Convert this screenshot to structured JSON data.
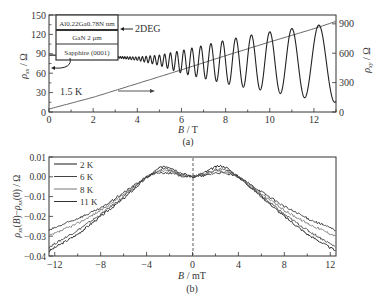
{
  "figure": {
    "panel_a_label": "(a)",
    "panel_b_label": "(b)"
  },
  "chart_data": [
    {
      "type": "line",
      "panel": "(a)",
      "xlabel": "B / T",
      "ylabel": "ρxx / Ω",
      "y2label": "ρxy / Ω",
      "xlim": [
        0,
        13
      ],
      "ylim": [
        0,
        150
      ],
      "y2lim": [
        0,
        990
      ],
      "xticks": [
        0,
        2,
        4,
        6,
        8,
        10,
        12
      ],
      "yticks": [
        0,
        30,
        60,
        90,
        120,
        150
      ],
      "y2ticks": [
        0,
        300,
        600,
        900
      ],
      "grid": false,
      "annotations": {
        "temperature": "1.5 K",
        "layer_stack": [
          "Al0.22Ga0.78N nm",
          "GaN   2 μm",
          "Sapphire (0001)"
        ],
        "layer_label": "2DEG",
        "arrow_left": "ρxx → left axis",
        "arrow_right": "ρxy → right axis"
      },
      "series": [
        {
          "name": "ρxx (Shubnikov–de Haas oscillations)",
          "axis": "left",
          "description": "Baseline ~88 Ω at B=0, slowly decreasing; oscillations begin near 3 T and grow in amplitude, reaching minima ~15 Ω and maxima ~135 Ω near 12.5 T",
          "x": [
            0,
            2,
            3,
            4,
            5,
            6,
            7,
            8,
            9,
            10,
            11,
            12,
            12.5,
            13
          ],
          "envelope_max": [
            88,
            87,
            86,
            85,
            88,
            95,
            103,
            111,
            118,
            124,
            129,
            134,
            135,
            135
          ],
          "envelope_min": [
            88,
            87,
            84,
            80,
            72,
            60,
            52,
            44,
            37,
            32,
            25,
            20,
            16,
            15
          ],
          "peaks_B": [
            8.35,
            8.85,
            9.35,
            9.95,
            10.6,
            11.4,
            12.4
          ],
          "color": "#222222"
        },
        {
          "name": "ρxy (Hall resistance)",
          "axis": "right",
          "description": "Nearly linear rise from ~0 at B=0 to ~920 Ω at 13 T",
          "x": [
            0,
            2,
            4,
            6,
            8,
            10,
            12,
            13
          ],
          "values": [
            30,
            150,
            290,
            430,
            575,
            715,
            850,
            925
          ],
          "color": "#555555"
        }
      ]
    },
    {
      "type": "line",
      "panel": "(b)",
      "xlabel": "B / mT",
      "ylabel": "ρxx(B) − ρxx(0) / Ω",
      "xlim": [
        -12.5,
        12.5
      ],
      "ylim": [
        -0.04,
        0.01
      ],
      "xticks": [
        -12,
        -8,
        -4,
        0,
        4,
        8,
        12
      ],
      "yticks": [
        -0.04,
        -0.03,
        -0.02,
        -0.01,
        0.0,
        0.01
      ],
      "grid": false,
      "legend": [
        "2 K",
        "6 K",
        "8 K",
        "11 K"
      ],
      "legend_position": "upper left",
      "annotations": {
        "dashed_vertical_line_at": 0
      },
      "series": [
        {
          "name": "2 K",
          "x": [
            -12.5,
            -10,
            -8,
            -6,
            -4,
            -3,
            -2.5,
            -2,
            -1,
            0,
            1,
            2,
            2.5,
            3,
            4,
            6,
            8,
            10,
            12.5
          ],
          "values": [
            -0.0375,
            -0.029,
            -0.02,
            -0.011,
            -0.0005,
            0.004,
            0.0055,
            0.005,
            0.002,
            0.0,
            0.002,
            0.005,
            0.0055,
            0.0045,
            0.0,
            -0.01,
            -0.02,
            -0.029,
            -0.0375
          ],
          "color": "#1a1a1a"
        },
        {
          "name": "6 K",
          "x": [
            -12.5,
            -10,
            -8,
            -6,
            -4,
            -3,
            -2.5,
            -2,
            -1,
            0,
            1,
            2,
            2.5,
            3,
            4,
            6,
            8,
            10,
            12.5
          ],
          "values": [
            -0.0355,
            -0.027,
            -0.019,
            -0.01,
            0.0,
            0.003,
            0.004,
            0.0035,
            0.0015,
            0.0,
            0.0015,
            0.0035,
            0.004,
            0.0035,
            0.0,
            -0.0095,
            -0.019,
            -0.027,
            -0.0355
          ],
          "color": "#444444"
        },
        {
          "name": "8 K",
          "x": [
            -12.5,
            -10,
            -8,
            -6,
            -4,
            -3,
            -2.5,
            -2,
            -1,
            0,
            1,
            2,
            2.5,
            3,
            4,
            6,
            8,
            10,
            12.5
          ],
          "values": [
            -0.03,
            -0.0235,
            -0.017,
            -0.009,
            0.0,
            0.0025,
            0.003,
            0.003,
            0.001,
            0.0,
            0.001,
            0.003,
            0.003,
            0.0025,
            0.0,
            -0.0085,
            -0.017,
            -0.0235,
            -0.03
          ],
          "color": "#777777"
        },
        {
          "name": "11 K",
          "x": [
            -12.5,
            -10,
            -8,
            -6,
            -4,
            -3,
            -2.5,
            -2,
            -1,
            0,
            1,
            2,
            2.5,
            3,
            4,
            6,
            8,
            10,
            12.5
          ],
          "values": [
            -0.027,
            -0.021,
            -0.016,
            -0.008,
            0.0,
            0.002,
            0.002,
            0.002,
            0.0005,
            0.0,
            0.0005,
            0.002,
            0.002,
            0.0015,
            0.0,
            -0.0075,
            -0.015,
            -0.021,
            -0.027
          ],
          "color": "#333333"
        }
      ]
    }
  ]
}
